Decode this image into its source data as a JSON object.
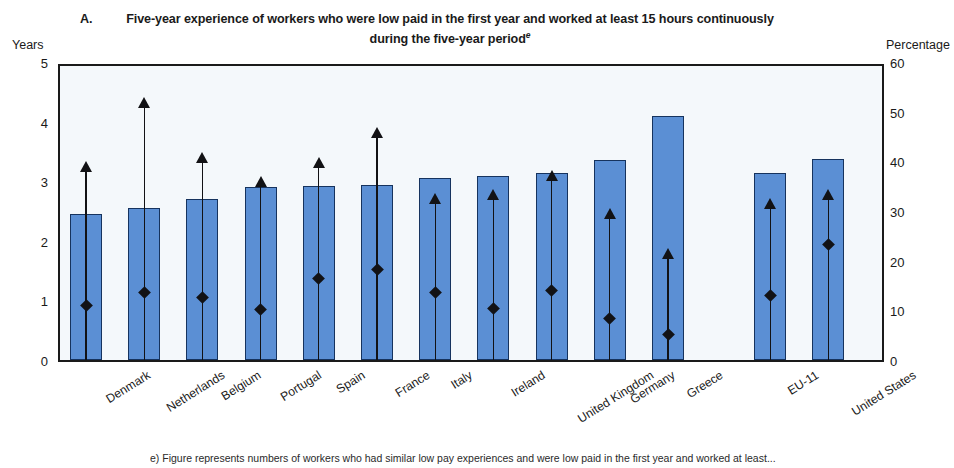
{
  "chart_data": {
    "type": "bar",
    "panel_letter": "A.",
    "title": "Five-year experience of workers who were low paid in the first year and worked at least 15 hours continuously during the five-year period",
    "title_line1": "Five-year experience of workers who were low paid in the first year and worked at least 15 hours continuously",
    "title_line2": "during the five-year period",
    "title_note_marker": "e",
    "ylabel_left": "Years",
    "ylabel_right": "Percentage",
    "ylim_left": [
      0,
      5
    ],
    "ylim_right": [
      0,
      60
    ],
    "yticks_left": [
      "5",
      "4",
      "3",
      "2",
      "1",
      "0"
    ],
    "yticks_right": [
      "60",
      "50",
      "40",
      "30",
      "20",
      "10",
      "0"
    ],
    "grid": false,
    "legend": "none",
    "categories": [
      "Denmark",
      "Netherlands",
      "Belgium",
      "Portugal",
      "Spain",
      "France",
      "Italy",
      "Ireland",
      "United Kingdom",
      "Germany",
      "Greece",
      "EU-11",
      "United States"
    ],
    "gap_before_index": 11,
    "series": [
      {
        "name": "Mean number of years low paid",
        "unit": "Years",
        "axis": "left",
        "marker": "bar",
        "values": [
          2.45,
          2.55,
          2.7,
          2.9,
          2.92,
          2.93,
          3.05,
          3.08,
          3.13,
          3.35,
          4.1,
          3.13,
          3.38
        ]
      },
      {
        "name": "Upper range value",
        "unit": "Years",
        "axis": "left",
        "marker": "arrow",
        "values": [
          3.25,
          4.33,
          3.4,
          3.0,
          3.33,
          3.83,
          2.72,
          2.78,
          3.1,
          2.47,
          1.8,
          2.63,
          2.78
        ]
      },
      {
        "name": "Percentage still low paid in the fifth year",
        "unit": "Percentage",
        "axis": "right",
        "marker": "diamond",
        "values": [
          11.7,
          14.3,
          13.3,
          11.0,
          17.3,
          19.0,
          14.4,
          11.2,
          14.8,
          9.1,
          6.0,
          13.7,
          24.0
        ]
      }
    ],
    "footnote": "e)  Figure represents numbers of workers who had similar low pay experiences and were low paid in the first year and worked at least..."
  },
  "colors": {
    "bar_fill": "#5b8fd4",
    "bar_edge": "#16335e",
    "marker": "#121215",
    "plot_bg": "#f4f8fb",
    "frame": "#1a1a1a"
  }
}
